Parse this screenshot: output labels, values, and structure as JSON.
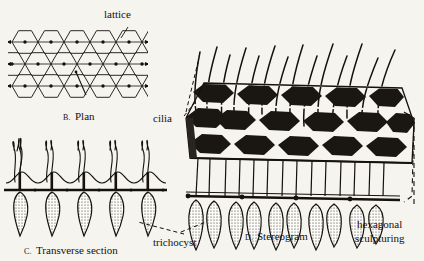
{
  "figure": {
    "background_color": "#f6f4ef",
    "ink_color": "#15110d"
  },
  "labels": {
    "lattice": "lattice",
    "cilia": "cilia",
    "trichocyst": "trichocyst",
    "hexagonal_sculpturing_line1": "hexagonal",
    "hexagonal_sculpturing_line2": "sculpturing"
  },
  "captions": {
    "plan": {
      "letter": "B.",
      "text": "Plan"
    },
    "transverse": {
      "letter": "C.",
      "text": "Transverse section"
    },
    "stereogram": {
      "letter": "D.",
      "text": "Stereogram"
    }
  },
  "panels": {
    "plan": {
      "name": "B. Plan",
      "description": "Hexagonal lattice grid, flat-top hexagons with central dots and horizontal rows",
      "hex_rows": 3,
      "hex_cols": 5,
      "hex_radius": 13
    },
    "transverse": {
      "name": "C. Transverse section",
      "description": "Side view: wavy pellicle membrane with basal bodies, cilia rising above, trichocysts below",
      "unit_count": 5
    },
    "stereogram": {
      "name": "D. Stereogram",
      "description": "Three-dimensional perspective of hexagonally sculptured pellicle with cilia above and trichocysts below",
      "plate_rows": 3,
      "cilia_count": 13,
      "trichocyst_count": 12
    }
  }
}
